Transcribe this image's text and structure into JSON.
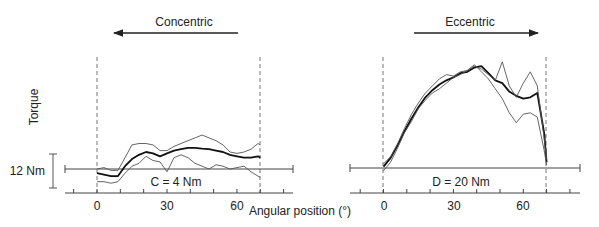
{
  "figure": {
    "y_axis_label": "Torque",
    "x_axis_label": "Angular position (°)",
    "scale_bar_label": "12 Nm",
    "scale_bar_value_nm": 12
  },
  "panels": [
    {
      "direction_label": "Concentric",
      "direction_arrow": "left",
      "baseline_label": "C = 4 Nm",
      "x_ticks": [
        "0",
        "30",
        "60"
      ]
    },
    {
      "direction_label": "Eccentric",
      "direction_arrow": "right",
      "baseline_label": "D = 20 Nm",
      "x_ticks": [
        "0",
        "30",
        "60"
      ]
    }
  ],
  "chart_data": [
    {
      "type": "line",
      "title": "Concentric",
      "xlabel": "Angular position (°)",
      "ylabel": "Torque",
      "baseline_annotation": "C = 4 Nm",
      "scale_bar": "12 Nm",
      "x_range": [
        -14,
        84
      ],
      "x_ticks": [
        0,
        30,
        60
      ],
      "range_of_motion_markers": [
        0,
        70
      ],
      "grid": false,
      "x": [
        0,
        3,
        6,
        9,
        12,
        15,
        18,
        21,
        24,
        27,
        30,
        33,
        36,
        39,
        42,
        45,
        48,
        51,
        54,
        57,
        60,
        63,
        66,
        69,
        70
      ],
      "series": [
        {
          "name": "mean",
          "style": "thick",
          "values": [
            -1.5,
            -2.0,
            -2.5,
            -2.5,
            1.0,
            3.5,
            5.0,
            6.0,
            5.5,
            4.5,
            5.5,
            6.5,
            7.0,
            7.5,
            7.5,
            7.2,
            7.0,
            6.5,
            6.0,
            5.0,
            4.5,
            4.0,
            4.0,
            4.5,
            4.0
          ]
        },
        {
          "name": "upper",
          "style": "thin",
          "values": [
            0.0,
            0.5,
            -0.5,
            -0.5,
            4.0,
            8.5,
            9.0,
            9.0,
            8.5,
            6.5,
            6.5,
            8.0,
            9.0,
            10.0,
            11.0,
            12.0,
            11.0,
            10.0,
            8.5,
            6.0,
            5.5,
            6.0,
            7.0,
            9.0,
            8.5
          ]
        },
        {
          "name": "lower",
          "style": "thin",
          "values": [
            -4.5,
            -4.5,
            -5.0,
            -4.5,
            -1.5,
            1.0,
            2.0,
            4.5,
            3.0,
            2.5,
            -1.0,
            4.0,
            5.0,
            4.0,
            2.0,
            1.0,
            0.0,
            1.5,
            1.0,
            0.0,
            0.5,
            1.0,
            -1.0,
            -2.5,
            -3.0
          ]
        }
      ]
    },
    {
      "type": "line",
      "title": "Eccentric",
      "xlabel": "Angular position (°)",
      "ylabel": "Torque",
      "baseline_annotation": "D = 20 Nm",
      "scale_bar": "12 Nm",
      "x_range": [
        -14,
        84
      ],
      "x_ticks": [
        0,
        30,
        60
      ],
      "range_of_motion_markers": [
        0,
        70
      ],
      "grid": false,
      "x": [
        0,
        3,
        6,
        9,
        12,
        15,
        18,
        21,
        24,
        27,
        30,
        33,
        36,
        39,
        42,
        45,
        48,
        51,
        54,
        57,
        60,
        63,
        66,
        69,
        70
      ],
      "series": [
        {
          "name": "mean",
          "style": "thick",
          "values": [
            0.5,
            3.5,
            8.0,
            13.0,
            17.5,
            21.5,
            25.0,
            27.5,
            29.5,
            31.0,
            32.0,
            33.5,
            34.0,
            35.5,
            36.0,
            33.5,
            31.0,
            30.0,
            27.0,
            25.5,
            24.5,
            25.0,
            26.5,
            12.0,
            2.0
          ]
        },
        {
          "name": "upper",
          "style": "thin",
          "values": [
            1.5,
            4.0,
            8.5,
            14.0,
            19.0,
            23.0,
            26.5,
            29.0,
            31.5,
            33.0,
            32.5,
            34.0,
            34.5,
            36.0,
            35.0,
            33.0,
            31.0,
            37.5,
            29.0,
            25.0,
            30.0,
            34.0,
            29.0,
            10.0,
            3.0
          ]
        },
        {
          "name": "lower",
          "style": "thin",
          "values": [
            -1.0,
            2.0,
            7.0,
            12.5,
            16.5,
            21.0,
            24.0,
            26.5,
            28.0,
            30.0,
            32.0,
            33.0,
            34.5,
            36.5,
            34.0,
            31.5,
            28.0,
            24.5,
            19.5,
            16.0,
            19.0,
            19.5,
            18.0,
            6.0,
            1.0
          ]
        }
      ]
    }
  ]
}
